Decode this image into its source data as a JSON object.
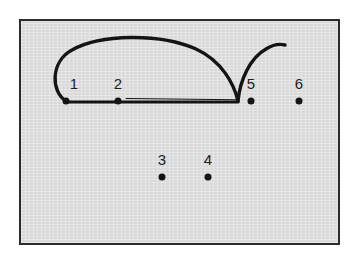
{
  "figure": {
    "title": "",
    "background_color": "#dedede",
    "page_background": "#ffffff",
    "border_color": "#2b2b2b",
    "ink_color": "#141414",
    "label_color": "#1d1d1d",
    "frame": {
      "x": 19,
      "y": 19,
      "width": 321,
      "height": 226,
      "border_width": 2
    }
  },
  "nodes": [
    {
      "id": "node-1",
      "label": "1",
      "x": 66,
      "y": 101,
      "label_x": 74,
      "label_y": 91,
      "on_baseline": true
    },
    {
      "id": "node-2",
      "label": "2",
      "x": 118,
      "y": 101,
      "label_x": 118,
      "label_y": 91,
      "on_baseline": true
    },
    {
      "id": "node-3",
      "label": "3",
      "x": 162,
      "y": 177,
      "label_x": 162,
      "label_y": 167,
      "on_baseline": false
    },
    {
      "id": "node-4",
      "label": "4",
      "x": 208,
      "y": 177,
      "label_x": 208,
      "label_y": 167,
      "on_baseline": false
    },
    {
      "id": "node-5",
      "label": "5",
      "x": 251,
      "y": 101,
      "label_x": 251,
      "label_y": 91,
      "on_baseline": true
    },
    {
      "id": "node-6",
      "label": "6",
      "x": 299,
      "y": 101,
      "label_x": 299,
      "label_y": 91,
      "on_baseline": true
    }
  ],
  "strokes": [
    {
      "name": "baseline-thick",
      "description": "thick horizontal segment from node 1 through node 2 to the cusp",
      "path": "M 66 102 L 238 102",
      "width": 3.2
    },
    {
      "name": "baseline-thin-upper",
      "description": "thin line just above the thick baseline converging at the cusp",
      "path": "M 126 98.5 L 236 99.8",
      "width": 1.1
    },
    {
      "name": "left-loop-arc",
      "description": "large arc looping up from node 1 over nodes 2-4 down to the cusp",
      "path": "M 66 101 C 51 92 50 62 72 50 C 100 34 160 33 196 49 C 222 61 234 84 238 101",
      "width": 3.4
    },
    {
      "name": "right-hook",
      "description": "stroke rising from the cusp to the right ending in a flat tail",
      "path": "M 238 101 C 240 80 250 58 266 49 C 274 44 281 44 285 45",
      "width": 3.4
    }
  ],
  "cusp": {
    "name": "cusp-point",
    "x": 238,
    "y": 101
  }
}
